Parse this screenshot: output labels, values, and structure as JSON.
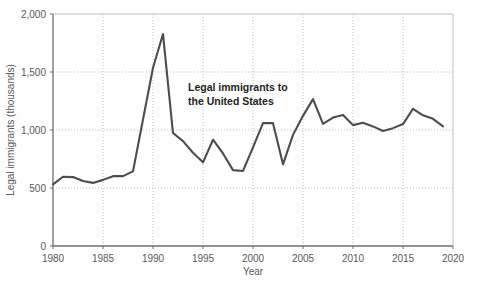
{
  "chart_data": {
    "type": "line",
    "title": "",
    "subtitle": "",
    "xlabel": "Year",
    "ylabel": "Legal immigrants (thousands)",
    "xlim": [
      1980,
      2020
    ],
    "ylim": [
      0,
      2000
    ],
    "xticks": [
      "1980",
      "1985",
      "1990",
      "1995",
      "2000",
      "2005",
      "2010",
      "2015",
      "2020"
    ],
    "xtick_values": [
      1980,
      1985,
      1990,
      1995,
      2000,
      2005,
      2010,
      2015,
      2020
    ],
    "yticks": [
      "0",
      "500",
      "1,000",
      "1,500",
      "2,000"
    ],
    "ytick_values": [
      0,
      500,
      1000,
      1500,
      2000
    ],
    "grid": "dotted-both",
    "legend_position": "inline-annotation",
    "annotations": [
      {
        "text_line1": "Legal immigrants to",
        "text_line2": "the United States",
        "x": 1993,
        "y": 1360
      }
    ],
    "series": [
      {
        "name": "Legal immigrants to the United States",
        "color": "#4d4d4d",
        "x": [
          1980,
          1981,
          1982,
          1983,
          1984,
          1985,
          1986,
          1987,
          1988,
          1989,
          1990,
          1991,
          1992,
          1993,
          1994,
          1995,
          1996,
          1997,
          1998,
          1999,
          2000,
          2001,
          2002,
          2003,
          2004,
          2005,
          2006,
          2007,
          2008,
          2009,
          2010,
          2011,
          2012,
          2013,
          2014,
          2015,
          2016,
          2017,
          2018,
          2019
        ],
        "values": [
          531,
          597,
          594,
          560,
          544,
          570,
          602,
          602,
          643,
          1091,
          1536,
          1827,
          974,
          904,
          804,
          721,
          916,
          798,
          654,
          647,
          850,
          1059,
          1059,
          704,
          958,
          1122,
          1266,
          1052,
          1107,
          1130,
          1042,
          1062,
          1031,
          991,
          1016,
          1051,
          1183,
          1127,
          1096,
          1031
        ]
      }
    ]
  },
  "axis": {
    "x_label": "Year",
    "y_label": "Legal immigrants (thousands)"
  },
  "colors": {
    "line": "#4d4d4d",
    "axis": "#6d6e71",
    "grid": "#bcbec0",
    "tick_text": "#58595b",
    "annotation_text": "#231f20",
    "background": "#ffffff"
  }
}
